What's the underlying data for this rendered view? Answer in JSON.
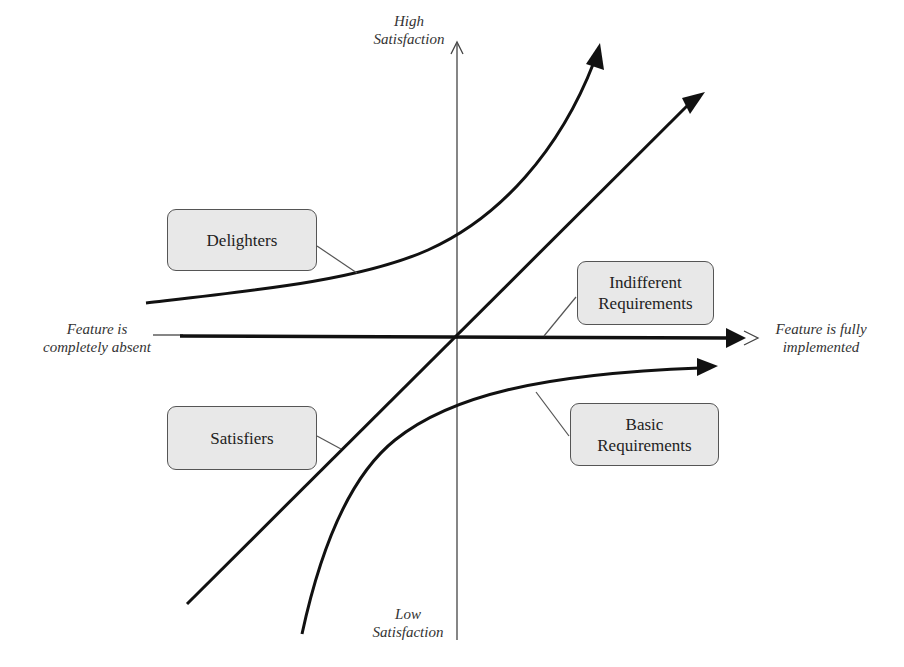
{
  "diagram": {
    "type": "Kano model",
    "axes": {
      "y_top_label": [
        "High",
        "Satisfaction"
      ],
      "y_bottom_label": [
        "Low",
        "Satisfaction"
      ],
      "x_left_label": [
        "Feature is",
        "completely absent"
      ],
      "x_right_label": [
        "Feature is fully",
        "implemented"
      ]
    },
    "categories": [
      {
        "id": "delighters",
        "lines": [
          "Delighters"
        ],
        "curve": "exponential rising"
      },
      {
        "id": "indifferent",
        "lines": [
          "Indifferent",
          "Requirements"
        ],
        "curve": "horizontal"
      },
      {
        "id": "satisfiers",
        "lines": [
          "Satisfiers"
        ],
        "curve": "linear diagonal"
      },
      {
        "id": "basic",
        "lines": [
          "Basic",
          "Requirements"
        ],
        "curve": "logarithmic saturating"
      }
    ],
    "colors": {
      "curve": "#111111",
      "axis": "#444444",
      "box_fill": "#e8e8e8",
      "box_border": "#555555",
      "leader": "#555555"
    }
  }
}
